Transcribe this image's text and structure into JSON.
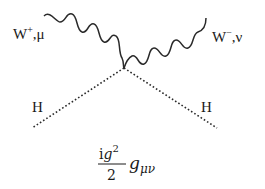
{
  "diagram": {
    "type": "feynman-vertex",
    "vertex": {
      "x": 124,
      "y": 68
    },
    "colors": {
      "line": "#2a2a2a",
      "text": "#1a1a1a",
      "background": "#ffffff"
    },
    "legs": [
      {
        "id": "w-plus",
        "kind": "wavy",
        "particle": "W",
        "charge": "+",
        "index": "μ",
        "label_main": "W",
        "label_sup": "+",
        "label_sep": ",",
        "label_index": "μ"
      },
      {
        "id": "w-minus",
        "kind": "wavy",
        "particle": "W",
        "charge": "−",
        "index": "ν",
        "label_main": "W",
        "label_sup": "−",
        "label_sep": ",",
        "label_index": "ν"
      },
      {
        "id": "h-left",
        "kind": "dotted",
        "particle": "H",
        "label_main": "H"
      },
      {
        "id": "h-right",
        "kind": "dotted",
        "particle": "H",
        "label_main": "H"
      }
    ],
    "vertex_factor": {
      "numerator_i": "i",
      "numerator_g": "g",
      "numerator_exp": "2",
      "denominator": "2",
      "metric": "g",
      "metric_indices": "μν"
    }
  }
}
